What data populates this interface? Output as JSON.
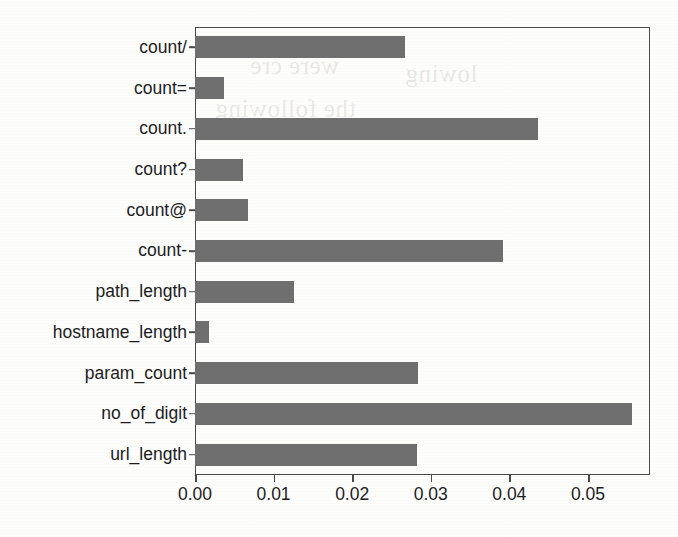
{
  "chart_data": {
    "type": "bar",
    "orientation": "horizontal",
    "title": "",
    "xlabel": "",
    "ylabel": "",
    "categories": [
      "count/",
      "count=",
      "count.",
      "count?",
      "count@",
      "count-",
      "path_length",
      "hostname_length",
      "param_count",
      "no_of_digit",
      "url_length"
    ],
    "values": [
      0.0267,
      0.0037,
      0.0437,
      0.0061,
      0.0068,
      0.0392,
      0.0126,
      0.0018,
      0.0284,
      0.0556,
      0.0283
    ],
    "xlim": [
      0.0,
      0.0579
    ],
    "xticks": [
      0.0,
      0.01,
      0.02,
      0.03,
      0.04,
      0.05
    ],
    "xtick_labels": [
      "0.00",
      "0.01",
      "0.02",
      "0.03",
      "0.04",
      "0.05"
    ],
    "grid": false,
    "legend": null,
    "bar_color": "#6f6f6f",
    "axis_color": "#4a4a4a",
    "background_color": "#fdfdfc"
  },
  "ghost_marks": [
    {
      "text": "were cre",
      "left": 250,
      "top": 52
    },
    {
      "text": "the following",
      "left": 215,
      "top": 95
    },
    {
      "text": "lowing",
      "left": 405,
      "top": 60
    }
  ]
}
